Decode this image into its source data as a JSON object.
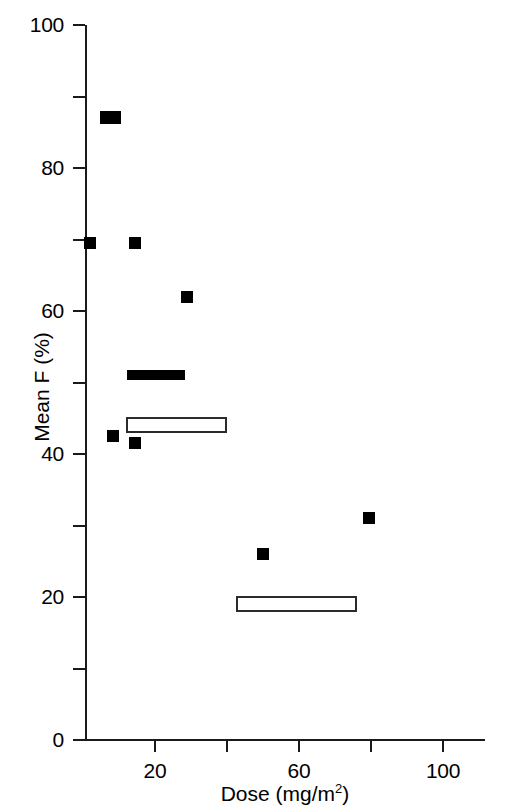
{
  "chart_data": {
    "type": "scatter",
    "title": "",
    "xlabel": "Dose (mg/m",
    "xlabel_sup": "2",
    "xlabel_close": ")",
    "xlabel_full": "Dose (mg/m2)",
    "ylabel": "Mean F (%)",
    "xlim": [
      0,
      111
    ],
    "ylim": [
      0,
      100
    ],
    "grid": false,
    "legend": "none",
    "x_ticks": [
      20,
      40,
      60,
      80,
      100
    ],
    "x_tick_labels": [
      "20",
      "",
      "60",
      "",
      "100"
    ],
    "y_ticks": [
      0,
      10,
      20,
      30,
      40,
      50,
      60,
      70,
      80,
      90,
      100
    ],
    "y_tick_labels": [
      "0",
      "",
      "20",
      "",
      "40",
      "",
      "60",
      "",
      "80",
      "",
      "100"
    ],
    "points": [
      {
        "name": "point-1",
        "dose": 7.5,
        "mean_f": 87,
        "marker": "filled-square-wide"
      },
      {
        "name": "point-2",
        "dose": 2.0,
        "mean_f": 69.5,
        "marker": "filled-square"
      },
      {
        "name": "point-3",
        "dose": 14.5,
        "mean_f": 69.5,
        "marker": "filled-square"
      },
      {
        "name": "point-4",
        "dose": 29.0,
        "mean_f": 62.0,
        "marker": "filled-square"
      },
      {
        "name": "point-5",
        "dose": 8.3,
        "mean_f": 42.5,
        "marker": "filled-square"
      },
      {
        "name": "point-6",
        "dose": 14.5,
        "mean_f": 41.5,
        "marker": "filled-square"
      },
      {
        "name": "point-7",
        "dose": 50.0,
        "mean_f": 26.0,
        "marker": "filled-square"
      },
      {
        "name": "point-8",
        "dose": 79.5,
        "mean_f": 31.0,
        "marker": "filled-square"
      }
    ],
    "range_bars": [
      {
        "name": "filled-range-bar",
        "dose_start": 12.2,
        "dose_end": 28.3,
        "mean_f": 51.0,
        "style": "filled"
      },
      {
        "name": "open-range-box-upper",
        "dose_start": 12.0,
        "dose_end": 40.0,
        "mean_f": 44.0,
        "style": "open"
      },
      {
        "name": "open-range-box-lower",
        "dose_start": 42.5,
        "dose_end": 76.0,
        "mean_f": 19.0,
        "style": "open"
      }
    ],
    "colors": {
      "marker_fill": "#000000",
      "axis": "#1a1a1a",
      "open_box_stroke": "#2b2b2b",
      "background": "#ffffff"
    }
  }
}
